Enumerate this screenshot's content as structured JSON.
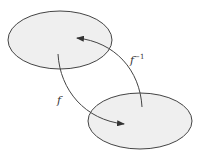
{
  "diagram": {
    "type": "function-mapping",
    "sets": [
      {
        "id": "domain",
        "cx": 60,
        "cy": 40,
        "rx": 52,
        "ry": 29
      },
      {
        "id": "codomain",
        "cx": 140,
        "cy": 121,
        "rx": 52,
        "ry": 28
      }
    ],
    "arrows": [
      {
        "id": "f",
        "label": "f",
        "from": "domain",
        "to": "codomain"
      },
      {
        "id": "f-inverse",
        "label": "f",
        "label_sup": "−1",
        "from": "codomain",
        "to": "domain"
      }
    ],
    "colors": {
      "set_fill": "#efefef",
      "stroke": "#444444",
      "background": "#ffffff"
    }
  }
}
